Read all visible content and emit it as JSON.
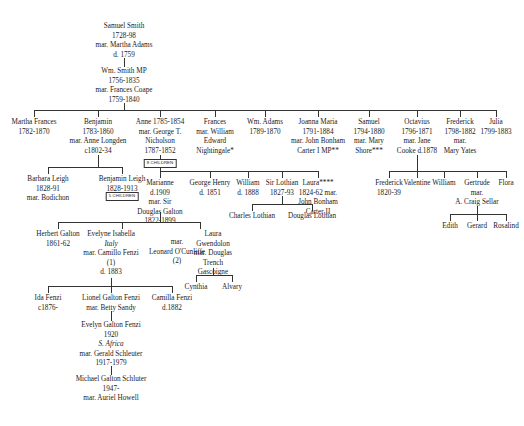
{
  "generations": {
    "g1": {
      "samuel_smith": {
        "lines": [
          "Samuel Smith",
          "1728-98",
          "mar. Martha Adams",
          "d. 1759"
        ]
      }
    },
    "g2": {
      "wm_smith": {
        "lines": [
          "Wm. Smith MP",
          "1756-1835",
          "mar. Frances Coape",
          "1759-1840"
        ]
      }
    },
    "g3": [
      {
        "lines": [
          "Martha Frances",
          "1782-1870"
        ]
      },
      {
        "lines": [
          "Benjamin",
          "1783-1860",
          "mar. Anne Longden",
          "c1802-34"
        ]
      },
      {
        "lines": [
          "Anne 1785-1854",
          "mar. George T.",
          "Nicholson",
          "1787-1852"
        ]
      },
      {
        "lines": [
          "Frances",
          "mar. William",
          "Edward",
          "Nightingale*"
        ]
      },
      {
        "lines": [
          "Wm. Adams",
          "1789-1870"
        ]
      },
      {
        "lines": [
          "Joanna Maria",
          "1791-1884",
          "mar. John Bonham",
          "Carter I MP**"
        ]
      },
      {
        "lines": [
          "Samuel",
          "1794-1880",
          "mar. Mary",
          "Shore***"
        ]
      },
      {
        "lines": [
          "Octavius",
          "1796-1871",
          "mar. Jane",
          "Cooke d.1878"
        ]
      },
      {
        "lines": [
          "Frederick",
          "1798-1882",
          "mar.",
          "Mary Yates"
        ]
      },
      {
        "lines": [
          "Julia",
          "1799-1883"
        ]
      }
    ],
    "g4_benjamin": [
      {
        "lines": [
          "Barbara Leigh",
          "1828-91",
          "mar. Bodichon"
        ]
      },
      {
        "lines": [
          "Benjamin Leigh",
          "1828-1913"
        ],
        "badge": "5 CHILDREN"
      }
    ],
    "g4_nicholson_badge": "8 CHILDREN",
    "g4_nicholson": [
      {
        "lines": [
          "Marianne",
          "d.1909",
          "mar. Sir",
          "Douglas Galton",
          "1822-1899"
        ]
      },
      {
        "lines": [
          "George Henry",
          "d. 1851"
        ]
      },
      {
        "lines": [
          "William",
          "d. 1888"
        ]
      },
      {
        "lines": [
          "Sir Lothian",
          "1827-93"
        ]
      },
      {
        "lines": [
          "Laura****",
          "1824-62 mar.",
          "John Bonham",
          "Carter II"
        ]
      }
    ],
    "g5_lothian": [
      {
        "lines": [
          "Charles Lothian"
        ]
      },
      {
        "lines": [
          "Douglas Lothian"
        ]
      }
    ],
    "g4_octavius": [
      {
        "lines": [
          "Frederick",
          "1820-39"
        ]
      },
      {
        "lines": [
          "Valentine"
        ]
      },
      {
        "lines": [
          "William"
        ]
      },
      {
        "lines": [
          "Gertrude",
          "mar.",
          "A. Craig Sellar"
        ]
      },
      {
        "lines": [
          "Flora"
        ]
      }
    ],
    "g5_sellar": [
      {
        "lines": [
          "Edith"
        ]
      },
      {
        "lines": [
          "Gerard"
        ]
      },
      {
        "lines": [
          "Rosalind"
        ]
      }
    ],
    "g5_galton": [
      {
        "lines": [
          "Herbert Galton",
          "1861-62"
        ]
      },
      {
        "lines": [
          "Evelyne Isabella",
          "Italy",
          "mar. Camillo Fenzi",
          "(1)",
          "d. 1883"
        ],
        "italic_index": 1
      },
      {
        "lines": [
          "mar.",
          "Leonard O'Cunliffe",
          "(2)"
        ]
      },
      {
        "lines": [
          "Laura",
          "Gwendolon",
          "mar. Douglas",
          "Trench",
          "Gascoigne"
        ]
      }
    ],
    "g6_gascoigne": [
      {
        "lines": [
          "Cynthia"
        ]
      },
      {
        "lines": [
          "Alvary"
        ]
      }
    ],
    "g6_fenzi": [
      {
        "lines": [
          "Ida Fenzi",
          "c1876-"
        ]
      },
      {
        "lines": [
          "Lionel Galton Fenzi",
          "mar. Betty Sandy"
        ]
      },
      {
        "lines": [
          "Camilla Fenzi",
          "d.1882"
        ]
      }
    ],
    "g7": {
      "lines": [
        "Evelyn Galton Fenzi",
        "1920",
        "S. Africa",
        "mar. Gerald Schleuter",
        "1917-1979"
      ],
      "italic_index": 2
    },
    "g8": {
      "lines": [
        "Michael Galton Schluter",
        "1947-",
        "mar. Auriel Howell"
      ]
    }
  }
}
